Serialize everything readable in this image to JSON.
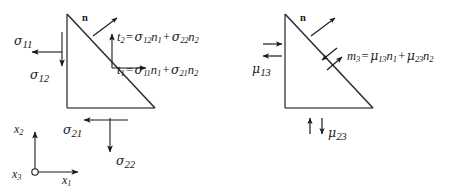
{
  "figure": {
    "background_color": "#ffffff",
    "line_color": "#4a4a4a",
    "arrow_color": "#1a1a1a",
    "text_color": "#1a1a1a"
  },
  "left_diagram": {
    "name": "force-traction-diagram",
    "normal_label": "n",
    "edge_labels": [
      {
        "id": "sigma11",
        "symbol": "σ",
        "sub": "11",
        "direction": "left"
      },
      {
        "id": "sigma12",
        "symbol": "σ",
        "sub": "12",
        "direction": "down"
      },
      {
        "id": "sigma21",
        "symbol": "σ",
        "sub": "21",
        "direction": "left"
      },
      {
        "id": "sigma22",
        "symbol": "σ",
        "sub": "22",
        "direction": "down"
      }
    ],
    "equations": [
      {
        "id": "t2",
        "lhs_symbol": "t",
        "lhs_sub": "2",
        "terms": [
          {
            "symbol": "σ",
            "sub": "12",
            "factor": "n",
            "factor_sub": "1"
          },
          {
            "symbol": "σ",
            "sub": "22",
            "factor": "n",
            "factor_sub": "2"
          }
        ],
        "full_text": "t2 = σ12n1 + σ22n2"
      },
      {
        "id": "t1",
        "lhs_symbol": "t",
        "lhs_sub": "1",
        "terms": [
          {
            "symbol": "σ",
            "sub": "11",
            "factor": "n",
            "factor_sub": "1"
          },
          {
            "symbol": "σ",
            "sub": "21",
            "factor": "n",
            "factor_sub": "2"
          }
        ],
        "full_text": "t1 = σ11n1 + σ21n2"
      }
    ]
  },
  "right_diagram": {
    "name": "couple-stress-diagram",
    "normal_label": "n",
    "edge_labels": [
      {
        "id": "mu13",
        "symbol": "μ",
        "sub": "13",
        "direction": "couple-horizontal"
      },
      {
        "id": "mu23",
        "symbol": "μ",
        "sub": "23",
        "direction": "couple-vertical"
      }
    ],
    "equations": [
      {
        "id": "m3",
        "lhs_symbol": "m",
        "lhs_sub": "3",
        "terms": [
          {
            "symbol": "μ",
            "sub": "13",
            "factor": "n",
            "factor_sub": "1"
          },
          {
            "symbol": "μ",
            "sub": "23",
            "factor": "n",
            "factor_sub": "2"
          }
        ],
        "full_text": "m3 = μ13n1 + μ23n2"
      }
    ]
  },
  "axes": {
    "name": "coordinate-axes",
    "vertical": {
      "symbol": "x",
      "sub": "2"
    },
    "horizontal": {
      "symbol": "x",
      "sub": "1"
    },
    "origin": {
      "symbol": "x",
      "sub": "3",
      "marker": "out-of-page-circle"
    }
  },
  "symbols": {
    "equals": "=",
    "plus": "+"
  }
}
